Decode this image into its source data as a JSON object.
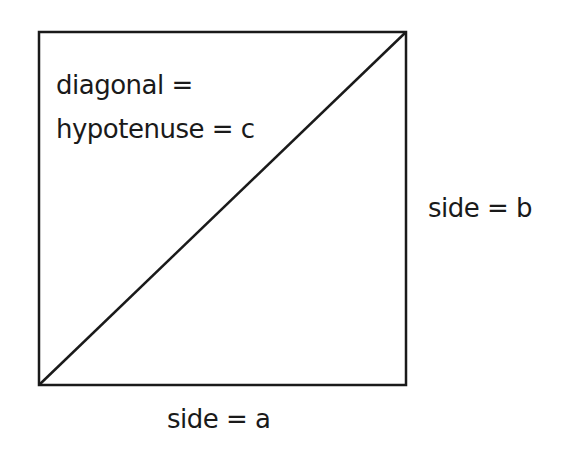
{
  "diagram": {
    "type": "square-with-diagonal",
    "colors": {
      "stroke": "#1a1a1a",
      "background": "#ffffff",
      "text": "#1a1a1a"
    },
    "square": {
      "x1": 39,
      "y1": 32,
      "x2": 406,
      "y2": 385
    },
    "diagonal": {
      "from": "bottom-left",
      "to": "top-right"
    },
    "labels": {
      "diagonal_line1": "diagonal =",
      "diagonal_line2": "hypotenuse = c",
      "side_b": "side = b",
      "side_a": "side = a"
    }
  }
}
